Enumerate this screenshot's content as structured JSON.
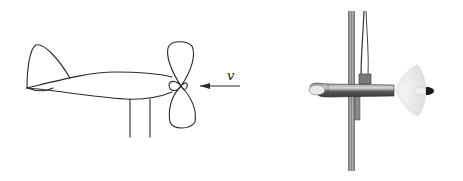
{
  "figure": {
    "left_panel": {
      "description": "Line drawing of a model airplane with a propeller facing into the oncoming flow",
      "flow_label": "v",
      "colors": {
        "stroke": "#2a2a2a"
      }
    },
    "right_panel": {
      "description": "Photograph of a propeller probe mounted on a vertical mast",
      "colors": {
        "body": "#6e6e6e",
        "propeller": "#e6e6e6",
        "nose": "#1a1a1a"
      }
    }
  }
}
